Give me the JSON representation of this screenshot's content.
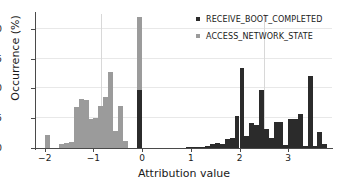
{
  "chart_data": {
    "type": "bar",
    "title": "",
    "xlabel": "Attribution value",
    "ylabel": "Occurrence (%)",
    "xlim": [
      -2.18,
      3.9
    ],
    "ylim": [
      0,
      22.5
    ],
    "xticks": [
      -2,
      -1,
      0,
      1,
      2,
      3
    ],
    "xticklabels": [
      "−2",
      "−1",
      "0",
      "1",
      "2",
      "3"
    ],
    "yticks": [
      0,
      5,
      10,
      15,
      20
    ],
    "yticklabels": [
      "0",
      "5",
      "10",
      "15",
      "20"
    ],
    "grid": "horizontal-minor",
    "gridlines_v": [
      -0.85,
      2.5
    ],
    "legend_position": "top-right",
    "bin_width": 0.1,
    "series": [
      {
        "name": "ACCESS_NETWORK_STATE",
        "color": "#9b9b9b",
        "bins": [
          {
            "x": -1.95,
            "value": 2.2
          },
          {
            "x": -1.85,
            "value": 0.0
          },
          {
            "x": -1.75,
            "value": 0.0
          },
          {
            "x": -1.65,
            "value": 0.7
          },
          {
            "x": -1.55,
            "value": 0.9
          },
          {
            "x": -1.45,
            "value": 1.0
          },
          {
            "x": -1.35,
            "value": 6.9
          },
          {
            "x": -1.25,
            "value": 8.2
          },
          {
            "x": -1.15,
            "value": 8.1
          },
          {
            "x": -1.05,
            "value": 4.8
          },
          {
            "x": -0.95,
            "value": 5.1
          },
          {
            "x": -0.85,
            "value": 7.1
          },
          {
            "x": -0.75,
            "value": 8.5
          },
          {
            "x": -0.65,
            "value": 12.8
          },
          {
            "x": -0.55,
            "value": 2.8
          },
          {
            "x": -0.45,
            "value": 7.0
          },
          {
            "x": -0.35,
            "value": 1.1
          },
          {
            "x": -0.05,
            "value": 22.0
          }
        ]
      },
      {
        "name": "RECEIVE_BOOT_COMPLETED",
        "color": "#2b2b2b",
        "bins": [
          {
            "x": -0.05,
            "value": 9.7
          },
          {
            "x": 0.95,
            "value": 0.2
          },
          {
            "x": 1.05,
            "value": 0.1
          },
          {
            "x": 1.15,
            "value": 0.15
          },
          {
            "x": 1.25,
            "value": 0.2
          },
          {
            "x": 1.35,
            "value": 0.3
          },
          {
            "x": 1.45,
            "value": 0.6
          },
          {
            "x": 1.55,
            "value": 0.8
          },
          {
            "x": 1.65,
            "value": 0.7
          },
          {
            "x": 1.75,
            "value": 1.5
          },
          {
            "x": 1.85,
            "value": 1.6
          },
          {
            "x": 1.95,
            "value": 5.4
          },
          {
            "x": 2.05,
            "value": 13.5
          },
          {
            "x": 2.15,
            "value": 2.1
          },
          {
            "x": 2.25,
            "value": 4.2
          },
          {
            "x": 2.35,
            "value": 3.9
          },
          {
            "x": 2.45,
            "value": 9.8
          },
          {
            "x": 2.55,
            "value": 3.2
          },
          {
            "x": 2.65,
            "value": 1.7
          },
          {
            "x": 2.75,
            "value": 4.4
          },
          {
            "x": 2.85,
            "value": 4.3
          },
          {
            "x": 2.95,
            "value": 0.5
          },
          {
            "x": 3.05,
            "value": 4.9
          },
          {
            "x": 3.15,
            "value": 4.9
          },
          {
            "x": 3.25,
            "value": 5.7
          },
          {
            "x": 3.35,
            "value": 0.4
          },
          {
            "x": 3.45,
            "value": 12.1
          },
          {
            "x": 3.55,
            "value": 0.3
          },
          {
            "x": 3.65,
            "value": 2.7
          },
          {
            "x": 3.75,
            "value": 0.7
          }
        ]
      }
    ],
    "legend": [
      {
        "label": "RECEIVE_BOOT_COMPLETED",
        "color": "#2b2b2b"
      },
      {
        "label": "ACCESS_NETWORK_STATE",
        "color": "#9b9b9b"
      }
    ]
  }
}
